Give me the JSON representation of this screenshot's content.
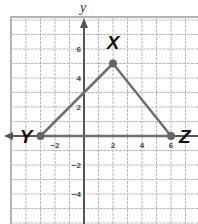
{
  "diagram": {
    "type": "coordinate-plane-triangle",
    "axis_label_y": "y",
    "colors": {
      "grid": "#b9b9b9",
      "axis": "#555555",
      "triangle": "#6e6e6e",
      "vertex": "#666666",
      "label": "#111111"
    },
    "x_ticks": [
      {
        "value": -2,
        "label": "−2"
      },
      {
        "value": 2,
        "label": "2"
      },
      {
        "value": 4,
        "label": "4"
      },
      {
        "value": 6,
        "label": "6"
      }
    ],
    "y_ticks": [
      {
        "value": 6,
        "label": "6"
      },
      {
        "value": 4,
        "label": "4"
      },
      {
        "value": 2,
        "label": "2"
      },
      {
        "value": -2,
        "label": "−2"
      },
      {
        "value": -4,
        "label": "−4"
      }
    ],
    "vertices": [
      {
        "name": "X",
        "x": 2,
        "y": 5
      },
      {
        "name": "Y",
        "x": -3,
        "y": 0
      },
      {
        "name": "Z",
        "x": 6,
        "y": 0
      }
    ]
  }
}
